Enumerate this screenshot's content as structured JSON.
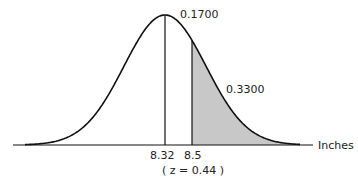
{
  "chart_data": {
    "type": "area",
    "title": "",
    "xlabel": "Inches",
    "ylabel": "",
    "distribution": "normal",
    "mean": 8.32,
    "x_marks": [
      {
        "value": 8.32,
        "label": "8.32"
      },
      {
        "value": 8.5,
        "label": "8.5"
      }
    ],
    "z_annotation": "( z = 0.44 )",
    "z_value": 0.44,
    "regions": [
      {
        "name": "mean-to-8.5",
        "from": 8.32,
        "to": 8.5,
        "area": 0.17,
        "label": "0.1700",
        "shaded": false
      },
      {
        "name": "above-8.5",
        "from": 8.5,
        "to": "inf",
        "area": 0.33,
        "label": "0.3300",
        "shaded": true
      }
    ],
    "grid": false,
    "legend": "none"
  },
  "labels": {
    "area_center": "0.1700",
    "area_tail": "0.3300",
    "axis": "Inches",
    "mean": "8.32",
    "cutoff": "8.5",
    "z": "( z = 0.44 )"
  },
  "colors": {
    "line": "#111111",
    "shade": "#c8c8c8"
  }
}
